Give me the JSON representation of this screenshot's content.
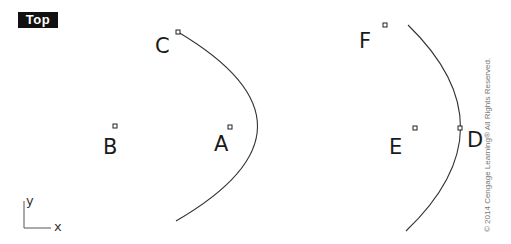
{
  "viewport": {
    "title": "Top"
  },
  "axes": {
    "x_label": "x",
    "y_label": "y"
  },
  "points": [
    {
      "id": "A",
      "label": "A",
      "marker": [
        230,
        127
      ]
    },
    {
      "id": "B",
      "label": "B",
      "marker": [
        115,
        126
      ]
    },
    {
      "id": "C",
      "label": "C",
      "marker": [
        178,
        32
      ]
    },
    {
      "id": "D",
      "label": "D",
      "marker": [
        460,
        128
      ]
    },
    {
      "id": "E",
      "label": "E",
      "marker": [
        415,
        128
      ]
    },
    {
      "id": "F",
      "label": "F",
      "marker": [
        385,
        25
      ]
    }
  ],
  "curves": [
    {
      "name": "left-parabola",
      "path": "M178,32 Q338,127 176,221"
    },
    {
      "name": "right-arc",
      "path": "M408,25 Q514,128 406,231"
    }
  ],
  "copyright": "© 2014 Cengage Learning®  All Rights Reserved."
}
